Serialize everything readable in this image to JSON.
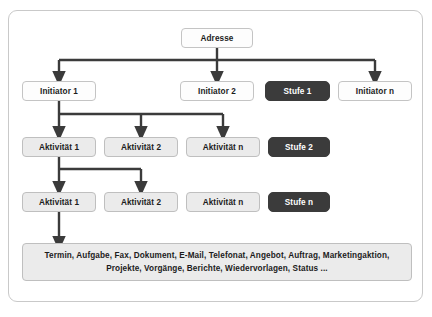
{
  "diagram": {
    "title": "Adresse",
    "frame_border_color": "#c9c9c9",
    "connector_color": "#3b3b3b",
    "dark_node_color": "#3b3b3b",
    "shaded_node_color": "#ebebeb",
    "root": {
      "label": "Adresse"
    },
    "level_labels": [
      {
        "label": "Stufe 1"
      },
      {
        "label": "Stufe 2"
      },
      {
        "label": "Stufe n"
      }
    ],
    "row_initiators": [
      {
        "label": "Initiator 1"
      },
      {
        "label": "Initiator 2"
      },
      {
        "label": "Initiator n"
      }
    ],
    "row_activities_1": [
      {
        "label": "Aktivität 1"
      },
      {
        "label": "Aktivität 2"
      },
      {
        "label": "Aktivität n"
      }
    ],
    "row_activities_2": [
      {
        "label": "Aktivität 1"
      },
      {
        "label": "Aktivität 2"
      },
      {
        "label": "Aktivität n"
      }
    ],
    "summary": {
      "line1": "Termin, Aufgabe, Fax, Dokument, E-Mail, Telefonat, Angebot, Auftrag, Marketingaktion,",
      "line2": "Projekte, Vorgänge, Berichte, Wiedervorlagen, Status ..."
    }
  }
}
